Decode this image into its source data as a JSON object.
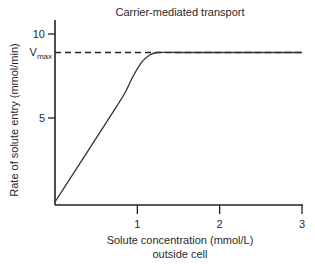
{
  "chart_data": {
    "type": "line",
    "title": "Carrier-mediated transport",
    "xlabel_line1": "Solute concentration (mmol/L)",
    "xlabel_line2": "outside cell",
    "ylabel": "Rate of solute entry (mmol/min)",
    "xlim": [
      0,
      3
    ],
    "ylim": [
      0,
      11
    ],
    "x_ticks": [
      1,
      2,
      3
    ],
    "x_tick_labels": [
      "1",
      "2",
      "3"
    ],
    "y_ticks": [
      5,
      10
    ],
    "y_tick_labels": [
      "5",
      "10"
    ],
    "grid": false,
    "vmax": {
      "value": 8.9,
      "label_main": "V",
      "label_sub": "max",
      "style": "dashed"
    },
    "series": [
      {
        "name": "Carrier-mediated transport",
        "x": [
          0,
          0.25,
          0.5,
          0.75,
          0.85,
          0.95,
          1.05,
          1.15,
          1.25,
          1.5,
          2.0,
          2.5,
          3.0
        ],
        "y": [
          0,
          1.9,
          3.8,
          5.7,
          6.5,
          7.5,
          8.3,
          8.75,
          8.9,
          8.9,
          8.9,
          8.9,
          8.9
        ]
      }
    ]
  }
}
